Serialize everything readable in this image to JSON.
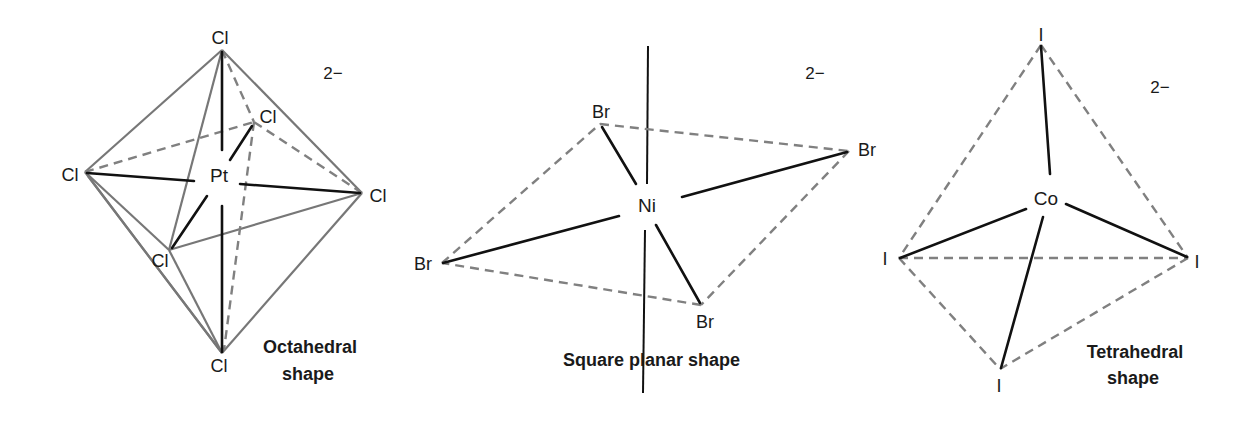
{
  "figure": {
    "background": "#ffffff",
    "colors": {
      "bond": "#111111",
      "edge": "#777777",
      "dashed_edge": "#808080",
      "text": "#1a1a1a"
    }
  },
  "panels": [
    {
      "id": "octahedral",
      "caption_line1": "Octahedral",
      "caption_line2": "shape",
      "charge": "2−",
      "central_atom": "Pt",
      "ligands": {
        "top": "Cl",
        "back": "Cl",
        "left": "Cl",
        "right": "Cl",
        "front": "Cl",
        "bottom": "Cl"
      }
    },
    {
      "id": "square-planar",
      "caption": "Square planar shape",
      "charge": "2−",
      "central_atom": "Ni",
      "ligands": {
        "top_left": "Br",
        "right": "Br",
        "left": "Br",
        "bottom": "Br"
      }
    },
    {
      "id": "tetrahedral",
      "caption_line1": "Tetrahedral",
      "caption_line2": "shape",
      "charge": "2−",
      "central_atom": "Co",
      "ligands": {
        "top": "I",
        "left": "I",
        "right": "I",
        "bottom": "I"
      }
    }
  ]
}
